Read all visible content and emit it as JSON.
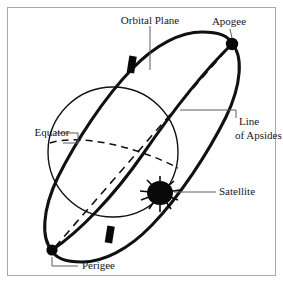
{
  "figure": {
    "background_color": "#ffffff",
    "frame_color": "#a8a8a8",
    "ink_color": "#111114",
    "leader_color": "#5d5d62"
  },
  "labels": {
    "orbital_plane": "Orbital Plane",
    "apogee": "Apogee",
    "line_of_apsides_line1": "Line",
    "line_of_apsides_line2": "of Apsides",
    "equator": "Equator",
    "satellite": "Satellite",
    "perigee": "Perigee"
  },
  "elements": {
    "globe": {
      "name": "earth-globe",
      "center_x": 113,
      "center_y": 152,
      "radius": 65
    },
    "orbit": {
      "name": "orbit-ellipse",
      "center_x": 142,
      "center_y": 147,
      "semi_major": 113,
      "semi_minor": 48,
      "rotation_deg": -63
    },
    "equator": {
      "name": "equator-line",
      "style": "dashed"
    },
    "line_of_apsides": {
      "name": "line-of-apsides",
      "style": "dashed",
      "from": "Perigee",
      "to": "Apogee"
    },
    "apogee_node": {
      "cx": 232,
      "cy": 44,
      "r": 6.2
    },
    "perigee_node": {
      "cx": 52,
      "cy": 250,
      "r": 5.6
    },
    "satellite_node": {
      "cx": 160,
      "cy": 193,
      "rx": 13,
      "ry": 12
    },
    "tick_top": {
      "x": 131,
      "y": 59
    },
    "tick_bottom": {
      "x": 109,
      "y": 232
    }
  }
}
